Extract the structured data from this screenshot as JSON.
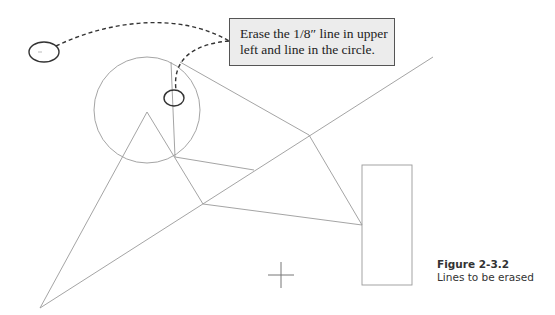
{
  "callout": {
    "line1": "Erase the 1/8″ line in upper",
    "line2": "left and line in the circle."
  },
  "caption": {
    "figure_label": "Figure 2-3.2",
    "description": "Lines to be erased"
  },
  "colors": {
    "geometry_line": "#9a9a9a",
    "marker": "#333333",
    "callout_bg": "#ececec",
    "callout_border": "#555555"
  },
  "drawing": {
    "circle": {
      "cx": 147,
      "cy": 110,
      "r": 53
    },
    "rectangle": {
      "x": 362,
      "y": 165,
      "w": 50,
      "h": 120
    },
    "crosshair": {
      "x": 281,
      "y": 275
    }
  }
}
